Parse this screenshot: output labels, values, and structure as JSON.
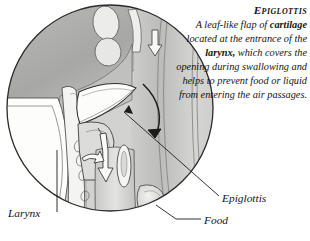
{
  "caption": {
    "title": "Epiglottis",
    "body_segments": [
      {
        "text": "A leaf-like flap of ",
        "bold": false
      },
      {
        "text": "cartilage",
        "bold": true
      },
      {
        "text": " located at the entrance of the ",
        "bold": false
      },
      {
        "text": "larynx,",
        "bold": true
      },
      {
        "text": " which covers the opening during swallowing and helps to prevent food or liquid from entering the air passages.",
        "bold": false
      }
    ],
    "body_text": "A leaf-like flap of cartilage located at the entrance of the larynx, which covers the opening during swallowing and helps to prevent food or liquid from entering the air passages."
  },
  "labels": {
    "larynx": "Larynx",
    "epiglottis": "Epiglottis",
    "food": "Food"
  },
  "illustration": {
    "title": "circular cutaway illustration of the human throat showing the epiglottis folding over the larynx during swallowing",
    "shape": "circle",
    "style": "pen-and-ink hatched medical engraving, grayscale",
    "colors": {
      "outline": "#2b2b2b",
      "tissue_light": "#e8e8e6",
      "tissue_mid": "#c6c6c4",
      "tissue_dark": "#9a9a98",
      "cartilage_white": "#fbfbfa",
      "background": "#ffffff"
    },
    "motion_arrows": [
      {
        "name": "epiglottis-fold-arrow",
        "description": "large curved arrow sweeping down over the epiglottis flap"
      },
      {
        "name": "food-swallow-arrow",
        "description": "hollow white arrow pointing down the esophagus"
      },
      {
        "name": "upper-passage-arrow",
        "description": "small hollow arrow at the top of the nasal passage"
      },
      {
        "name": "lower-tongue-arrow",
        "description": "small hollow arrow curving beneath the tongue base"
      }
    ]
  }
}
